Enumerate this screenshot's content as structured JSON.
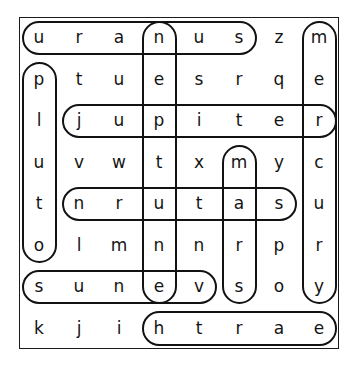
{
  "puzzle": {
    "type": "word-search",
    "rows": 8,
    "columns": 8,
    "grid": [
      [
        "u",
        "r",
        "a",
        "n",
        "u",
        "s",
        "z",
        "m"
      ],
      [
        "p",
        "t",
        "u",
        "e",
        "s",
        "r",
        "q",
        "e"
      ],
      [
        "l",
        "j",
        "u",
        "p",
        "i",
        "t",
        "e",
        "r"
      ],
      [
        "u",
        "v",
        "w",
        "t",
        "x",
        "m",
        "y",
        "c"
      ],
      [
        "t",
        "n",
        "r",
        "u",
        "t",
        "a",
        "s",
        "u"
      ],
      [
        "o",
        "l",
        "m",
        "n",
        "n",
        "r",
        "p",
        "r"
      ],
      [
        "s",
        "u",
        "n",
        "e",
        "v",
        "s",
        "o",
        "y"
      ],
      [
        "k",
        "j",
        "i",
        "h",
        "t",
        "r",
        "a",
        "e"
      ]
    ],
    "found_words": [
      {
        "word": "uranus",
        "orientation": "horizontal",
        "direction": "left-to-right",
        "letters": "u r a n u s",
        "start_row": 1,
        "start_col": 1,
        "end_row": 1,
        "end_col": 6
      },
      {
        "word": "mercury",
        "orientation": "vertical",
        "direction": "top-to-bottom",
        "letters": "m e r c u r y",
        "start_row": 1,
        "start_col": 8,
        "end_row": 7,
        "end_col": 8
      },
      {
        "word": "neptune",
        "orientation": "vertical",
        "direction": "top-to-bottom",
        "letters": "n e p t u n e",
        "start_row": 1,
        "start_col": 4,
        "end_row": 7,
        "end_col": 4
      },
      {
        "word": "pluto",
        "orientation": "vertical",
        "direction": "top-to-bottom",
        "letters": "p l u t o",
        "start_row": 2,
        "start_col": 1,
        "end_row": 6,
        "end_col": 1
      },
      {
        "word": "jupiter",
        "orientation": "horizontal",
        "direction": "left-to-right",
        "letters": "j u p i t e r",
        "start_row": 3,
        "start_col": 2,
        "end_row": 3,
        "end_col": 8
      },
      {
        "word": "mars",
        "orientation": "vertical",
        "direction": "top-to-bottom",
        "letters": "m a r s",
        "start_row": 4,
        "start_col": 6,
        "end_row": 7,
        "end_col": 6
      },
      {
        "word": "saturn",
        "orientation": "horizontal",
        "direction": "right-to-left",
        "letters": "n r u t a s",
        "start_row": 5,
        "start_col": 2,
        "end_row": 5,
        "end_col": 7
      },
      {
        "word": "venus",
        "orientation": "horizontal",
        "direction": "right-to-left",
        "letters": "s u n e v",
        "start_row": 7,
        "start_col": 1,
        "end_row": 7,
        "end_col": 5
      },
      {
        "word": "earth",
        "orientation": "horizontal",
        "direction": "right-to-left",
        "letters": "h t r a e",
        "start_row": 8,
        "start_col": 4,
        "end_row": 8,
        "end_col": 8
      }
    ],
    "colors": {
      "ink": "#141414",
      "oval_stroke": "#121212",
      "frame": "#1b1b1b",
      "background": "#ffffff"
    }
  }
}
